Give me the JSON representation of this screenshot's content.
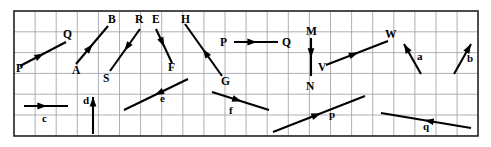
{
  "figure": {
    "background_color": "#ffffff",
    "grid_color": "#9a9aa6",
    "frame_color": "#2a2a2a",
    "vector_color": "#000000",
    "grid": {
      "x0": 14,
      "y0": 11,
      "x1": 478,
      "y1": 136,
      "cell_width": 21.1,
      "cell_height": 20.8,
      "columns": 22,
      "rows": 6
    }
  },
  "labels": {
    "P1": "P",
    "Q1": "Q",
    "A": "A",
    "B": "B",
    "R": "R",
    "S": "S",
    "E": "E",
    "F": "F",
    "H": "H",
    "G": "G",
    "P2": "P",
    "Q2": "Q",
    "M": "M",
    "N": "N",
    "V": "V",
    "W": "W",
    "a": "a",
    "b": "b",
    "c": "c",
    "d": "d",
    "e": "e",
    "f": "f",
    "p": "p",
    "q": "q"
  },
  "vectors": [
    {
      "name": "vector-PQ-upper-left",
      "tail_label": "P",
      "head_label": "Q",
      "tail": [
        20,
        66
      ],
      "head": [
        66,
        42
      ],
      "head_position": "mid"
    },
    {
      "name": "vector-AB",
      "tail_label": "A",
      "head_label": "B",
      "tail": [
        76,
        64
      ],
      "head": [
        108,
        26
      ],
      "head_position": "mid"
    },
    {
      "name": "vector-RS",
      "tail_label": "R",
      "head_label": "S",
      "tail": [
        140,
        29
      ],
      "head": [
        110,
        71
      ],
      "head_position": "mid"
    },
    {
      "name": "vector-EF",
      "tail_label": "E",
      "head_label": "F",
      "tail": [
        156,
        29
      ],
      "head": [
        172,
        63
      ],
      "head_position": "mid"
    },
    {
      "name": "vector-HG",
      "tail_label": "H",
      "head_label": "G",
      "tail": [
        222,
        76
      ],
      "head": [
        185,
        24
      ],
      "head_position": "mid"
    },
    {
      "name": "vector-PQ-middle",
      "tail_label": "P",
      "head_label": "Q",
      "tail": [
        234,
        42
      ],
      "head": [
        278,
        42
      ],
      "head_position": "mid"
    },
    {
      "name": "vector-MN",
      "tail_label": "M",
      "head_label": "N",
      "tail": [
        311,
        38
      ],
      "head": [
        311,
        76
      ],
      "head_position": "mid"
    },
    {
      "name": "vector-VW",
      "tail_label": "V",
      "head_label": "W",
      "tail": [
        326,
        65
      ],
      "head": [
        388,
        41
      ],
      "head_position": "mid"
    },
    {
      "name": "vector-a",
      "tail_label": "",
      "head_label": "a",
      "tail": [
        421,
        74
      ],
      "head": [
        404,
        44
      ],
      "head_position": "end"
    },
    {
      "name": "vector-b",
      "tail_label": "",
      "head_label": "b",
      "tail": [
        454,
        74
      ],
      "head": [
        471,
        44
      ],
      "head_position": "end"
    },
    {
      "name": "vector-c",
      "tail_label": "",
      "head_label": "c",
      "tail": [
        24,
        106
      ],
      "head": [
        68,
        106
      ],
      "head_position": "mid"
    },
    {
      "name": "vector-d",
      "tail_label": "",
      "head_label": "d",
      "tail": [
        93,
        134
      ],
      "head": [
        93,
        97
      ],
      "head_position": "end"
    },
    {
      "name": "vector-e",
      "tail_label": "",
      "head_label": "e",
      "tail": [
        188,
        79
      ],
      "head": [
        124,
        110
      ],
      "head_position": "mid"
    },
    {
      "name": "vector-f",
      "tail_label": "",
      "head_label": "f",
      "tail": [
        212,
        92
      ],
      "head": [
        269,
        110
      ],
      "head_position": "mid"
    },
    {
      "name": "vector-p",
      "tail_label": "",
      "head_label": "p",
      "tail": [
        273,
        132
      ],
      "head": [
        365,
        96
      ],
      "head_position": "mid"
    },
    {
      "name": "vector-q",
      "tail_label": "",
      "head_label": "q",
      "tail": [
        471,
        128
      ],
      "head": [
        381,
        113
      ],
      "head_position": "mid"
    }
  ],
  "label_positions": [
    {
      "key": "P1",
      "x": 16,
      "y": 72,
      "size": "upper"
    },
    {
      "key": "Q1",
      "x": 63,
      "y": 38,
      "size": "upper"
    },
    {
      "key": "A",
      "x": 72,
      "y": 74,
      "size": "upper"
    },
    {
      "key": "B",
      "x": 108,
      "y": 23,
      "size": "upper"
    },
    {
      "key": "R",
      "x": 135,
      "y": 23,
      "size": "upper"
    },
    {
      "key": "S",
      "x": 103,
      "y": 82,
      "size": "upper"
    },
    {
      "key": "E",
      "x": 152,
      "y": 23,
      "size": "upper"
    },
    {
      "key": "F",
      "x": 168,
      "y": 71,
      "size": "upper"
    },
    {
      "key": "H",
      "x": 181,
      "y": 23,
      "size": "upper"
    },
    {
      "key": "G",
      "x": 221,
      "y": 85,
      "size": "upper"
    },
    {
      "key": "P2",
      "x": 220,
      "y": 46,
      "size": "upper"
    },
    {
      "key": "Q2",
      "x": 282,
      "y": 46,
      "size": "upper"
    },
    {
      "key": "M",
      "x": 306,
      "y": 35,
      "size": "upper"
    },
    {
      "key": "N",
      "x": 306,
      "y": 90,
      "size": "upper"
    },
    {
      "key": "V",
      "x": 318,
      "y": 71,
      "size": "upper"
    },
    {
      "key": "W",
      "x": 385,
      "y": 38,
      "size": "upper"
    },
    {
      "key": "a",
      "x": 417,
      "y": 60,
      "size": "lower"
    },
    {
      "key": "b",
      "x": 467,
      "y": 62,
      "size": "lower"
    },
    {
      "key": "c",
      "x": 42,
      "y": 122,
      "size": "lower"
    },
    {
      "key": "d",
      "x": 83,
      "y": 104,
      "size": "lower"
    },
    {
      "key": "e",
      "x": 160,
      "y": 102,
      "size": "lower"
    },
    {
      "key": "f",
      "x": 229,
      "y": 114,
      "size": "lower"
    },
    {
      "key": "p",
      "x": 329,
      "y": 118,
      "size": "lower"
    },
    {
      "key": "q",
      "x": 423,
      "y": 130,
      "size": "lower"
    }
  ]
}
